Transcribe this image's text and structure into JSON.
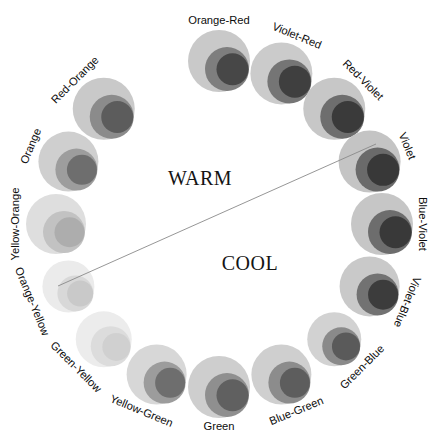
{
  "chart_data": {
    "type": "pie",
    "xlabel": "",
    "ylabel": "",
    "legend_position": "none",
    "grid": false,
    "center_labels": [
      {
        "text": "WARM",
        "x": 200,
        "y": 185
      },
      {
        "text": "COOL",
        "x": 250,
        "y": 270
      }
    ],
    "divider": {
      "x1": 58,
      "y1": 286,
      "x2": 376,
      "y2": 144
    },
    "geometry": {
      "center_x": 219,
      "center_y": 224,
      "swatch_radius_ring": 163,
      "label_radius": 203,
      "segment_count": 16,
      "start_angle_deg": -90
    },
    "categories": [
      "Orange-Red",
      "Violet-Red",
      "Red-Violet",
      "Violet",
      "Blue-Violet",
      "Violet-Blue",
      "Green-Blue",
      "Blue-Green",
      "Green",
      "Yellow-Green",
      "Green-Yellow",
      "Orange-Yellow",
      "Yellow-Orange",
      "Orange",
      "Red-Orange",
      "Violet-Red-dup"
    ],
    "values": [
      1,
      1,
      1,
      1,
      1,
      1,
      1,
      1,
      1,
      1,
      1,
      1,
      1,
      1,
      1,
      1
    ],
    "segments": [
      {
        "label": "Orange-Red",
        "angle": -90,
        "outer_r": 31,
        "mid_r": 22,
        "inner_r": 16,
        "outer": "#c9c9c9",
        "mid": "#7e7e7e",
        "inner": "#474747",
        "flip": false
      },
      {
        "label": "Violet-Red",
        "angle": -67.5,
        "outer_r": 31,
        "mid_r": 22,
        "inner_r": 16,
        "outer": "#cbcbcb",
        "mid": "#757575",
        "inner": "#3f3f3f",
        "flip": false
      },
      {
        "label": "Red-Violet",
        "angle": -45,
        "outer_r": 31,
        "mid_r": 22,
        "inner_r": 16,
        "outer": "#c7c7c7",
        "mid": "#6e6e6e",
        "inner": "#3a3a3a",
        "flip": false
      },
      {
        "label": "Violet",
        "angle": -22.5,
        "outer_r": 31,
        "mid_r": 22,
        "inner_r": 16,
        "outer": "#c4c4c4",
        "mid": "#6a6a6a",
        "inner": "#383838",
        "flip": false
      },
      {
        "label": "Blue-Violet",
        "angle": 0,
        "outer_r": 31,
        "mid_r": 22,
        "inner_r": 16,
        "outer": "#c6c6c6",
        "mid": "#6d6d6d",
        "inner": "#393939",
        "flip": false
      },
      {
        "label": "Violet-Blue",
        "angle": 22.5,
        "outer_r": 30,
        "mid_r": 21,
        "inner_r": 15,
        "outer": "#c9c9c9",
        "mid": "#727272",
        "inner": "#3c3c3c",
        "flip": false
      },
      {
        "label": "Green-Blue",
        "angle": 45,
        "outer_r": 27,
        "mid_r": 19,
        "inner_r": 14,
        "outer": "#d2d2d2",
        "mid": "#8a8a8a",
        "inner": "#5a5a5a",
        "flip": true
      },
      {
        "label": "Blue-Green",
        "angle": 67.5,
        "outer_r": 30,
        "mid_r": 21,
        "inner_r": 15,
        "outer": "#cfcfcf",
        "mid": "#8c8c8c",
        "inner": "#5d5d5d",
        "flip": true
      },
      {
        "label": "Green",
        "angle": 90,
        "outer_r": 31,
        "mid_r": 22,
        "inner_r": 16,
        "outer": "#cecece",
        "mid": "#8f8f8f",
        "inner": "#606060",
        "flip": true
      },
      {
        "label": "Yellow-Green",
        "angle": 112.5,
        "outer_r": 30,
        "mid_r": 21,
        "inner_r": 15,
        "outer": "#d7d7d7",
        "mid": "#9c9c9c",
        "inner": "#6e6e6e",
        "flip": true
      },
      {
        "label": "Green-Yellow",
        "angle": 135,
        "outer_r": 28,
        "mid_r": 20,
        "inner_r": 14,
        "outer": "#ececec",
        "mid": "#dcdcdc",
        "inner": "#d0d0d0",
        "flip": true
      },
      {
        "label": "Orange-Yellow",
        "angle": 157.5,
        "outer_r": 26,
        "mid_r": 18,
        "inner_r": 13,
        "outer": "#ebebeb",
        "mid": "#d8d8d8",
        "inner": "#c9c9c9",
        "flip": true
      },
      {
        "label": "Yellow-Orange",
        "angle": 180,
        "outer_r": 30,
        "mid_r": 21,
        "inner_r": 15,
        "outer": "#dedede",
        "mid": "#c2c2c2",
        "inner": "#adadad",
        "flip": false
      },
      {
        "label": "Orange",
        "angle": 202.5,
        "outer_r": 30,
        "mid_r": 21,
        "inner_r": 15,
        "outer": "#cfcfcf",
        "mid": "#9d9d9d",
        "inner": "#6e6e6e",
        "flip": false
      },
      {
        "label": "Red-Orange",
        "angle": 225,
        "outer_r": 31,
        "mid_r": 22,
        "inner_r": 16,
        "outer": "#c9c9c9",
        "mid": "#8b8b8b",
        "inner": "#5c5c5c",
        "flip": false
      },
      {
        "label": "Orange-Red2",
        "angle": 247.5,
        "outer_r": 0,
        "mid_r": 0,
        "inner_r": 0,
        "outer": "#ffffff",
        "mid": "#ffffff",
        "inner": "#ffffff",
        "flip": false
      }
    ]
  },
  "palette": {
    "background": "#ffffff",
    "label_color": "#0d0d0d",
    "divider_color": "#8a8a8a"
  }
}
